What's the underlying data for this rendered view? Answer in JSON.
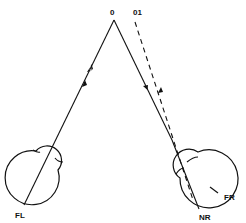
{
  "diagram": {
    "labels": {
      "apex": "0",
      "apex_offset": "01",
      "left_eye": "FL",
      "right_eye_nasal": "NR",
      "right_eye_fovea": "FR"
    },
    "colors": {
      "stroke": "#111111",
      "background": "#ffffff"
    },
    "elements": {
      "left_eye": "eye-diagram-left",
      "right_eye": "eye-diagram-right",
      "left_visual_axis": "solid line from FL to 0 with bidirectional arrows",
      "right_visual_axis": "solid line from 0 to NR with downward arrow",
      "right_dashed_axis": "dashed line from FR to 01 with upward arrow"
    }
  }
}
